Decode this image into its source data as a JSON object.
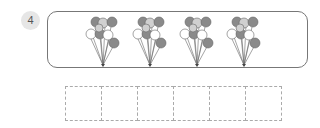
{
  "question": {
    "number": "4",
    "balloon_clusters": 4,
    "answer_boxes": 6
  },
  "colors": {
    "badge_bg": "#e6e6e6",
    "balloon_dark": "#8a8a8a",
    "balloon_light": "#d0d0d0",
    "balloon_white": "#ffffff",
    "border": "#777777",
    "box_border": "#aaaaaa"
  },
  "icons": {
    "cluster": "balloon-bunch-icon"
  }
}
